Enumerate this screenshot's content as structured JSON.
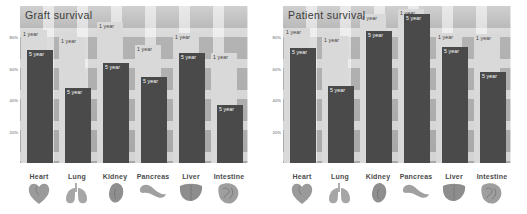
{
  "charts": [
    {
      "title": "Graft survival",
      "ylabel_ticks": [
        "80%",
        "60%",
        "40%",
        "20%"
      ],
      "categories": [
        "Heart",
        "Lung",
        "Kidney",
        "Pancreas",
        "Liver",
        "Intestine"
      ],
      "series_labels": {
        "one": "1 year",
        "five": "5 year"
      },
      "one_year": [
        85,
        80,
        90,
        75,
        83,
        70
      ],
      "five_year": [
        72,
        48,
        64,
        55,
        70,
        37
      ]
    },
    {
      "title": "Patient survival",
      "ylabel_ticks": [
        "80%",
        "60%",
        "40%",
        "20%"
      ],
      "categories": [
        "Heart",
        "Lung",
        "Kidney",
        "Pancreas",
        "Liver",
        "Intestine"
      ],
      "series_labels": {
        "one": "1 year",
        "five": "5 year"
      },
      "one_year": [
        86,
        81,
        95,
        98,
        83,
        82
      ],
      "five_year": [
        73,
        49,
        84,
        95,
        74,
        58
      ]
    }
  ],
  "chart_data": [
    {
      "type": "bar",
      "title": "Graft survival",
      "xlabel": "",
      "ylabel": "",
      "ylim": [
        0,
        100
      ],
      "grid": true,
      "legend": "inline bar labels",
      "categories": [
        "Heart",
        "Lung",
        "Kidney",
        "Pancreas",
        "Liver",
        "Intestine"
      ],
      "tick_labels": [
        "20%",
        "40%",
        "60%",
        "80%"
      ],
      "series": [
        {
          "name": "1 year",
          "values": [
            85,
            80,
            90,
            75,
            83,
            70
          ],
          "color": "#d9d9d9"
        },
        {
          "name": "5 year",
          "values": [
            72,
            48,
            64,
            55,
            70,
            37
          ],
          "color": "#4a4a4a"
        }
      ]
    },
    {
      "type": "bar",
      "title": "Patient survival",
      "xlabel": "",
      "ylabel": "",
      "ylim": [
        0,
        100
      ],
      "grid": true,
      "legend": "inline bar labels",
      "categories": [
        "Heart",
        "Lung",
        "Kidney",
        "Pancreas",
        "Liver",
        "Intestine"
      ],
      "tick_labels": [
        "20%",
        "40%",
        "60%",
        "80%"
      ],
      "series": [
        {
          "name": "1 year",
          "values": [
            86,
            81,
            95,
            98,
            83,
            82
          ],
          "color": "#d9d9d9"
        },
        {
          "name": "5 year",
          "values": [
            73,
            49,
            84,
            95,
            74,
            58
          ],
          "color": "#4a4a4a"
        }
      ]
    }
  ]
}
